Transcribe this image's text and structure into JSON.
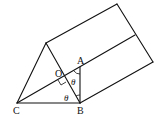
{
  "diagram": {
    "type": "triangular-prism",
    "labels": {
      "A": "A",
      "O": "O",
      "B": "B",
      "C": "C",
      "theta_upper": "θ",
      "theta_lower": "θ"
    },
    "points": {
      "apex_front": [
        46,
        43
      ],
      "C": [
        17,
        103
      ],
      "B": [
        80,
        103
      ],
      "A": [
        80,
        67
      ],
      "O": [
        63,
        77
      ],
      "apex_back": [
        117,
        4
      ],
      "mid_back": [
        135,
        35
      ],
      "B_back": [
        153,
        62
      ]
    },
    "annotations": {
      "right_angle_at": "O",
      "angles": [
        "angle OAB = θ",
        "angle OBC = θ"
      ]
    },
    "colors": {
      "stroke": "#111111",
      "background": "#ffffff"
    }
  }
}
